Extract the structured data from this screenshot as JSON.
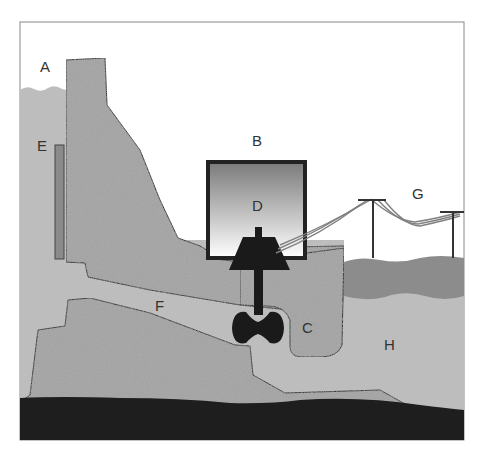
{
  "diagram": {
    "colors": {
      "frame": "#888888",
      "reservoir_water": "#bdbdbd",
      "dam_concrete": "#a8a8a8",
      "bedrock": "#1e1e1e",
      "river_surface": "#8c8c8c",
      "intake_gate": "#8a8a8a",
      "machinery": "#1a1a1a",
      "powerhouse_border": "#222222",
      "powerline": "#808080"
    },
    "labels": [
      {
        "id": "A",
        "text": "A",
        "x": 40,
        "y": 72,
        "meaning": "reservoir"
      },
      {
        "id": "B",
        "text": "B",
        "x": 252,
        "y": 146,
        "meaning": "powerhouse"
      },
      {
        "id": "C",
        "text": "C",
        "x": 302,
        "y": 333,
        "meaning": "turbine housing"
      },
      {
        "id": "D",
        "text": "D",
        "x": 252,
        "y": 211,
        "meaning": "generator"
      },
      {
        "id": "E",
        "text": "E",
        "x": 37,
        "y": 151,
        "meaning": "intake gate"
      },
      {
        "id": "F",
        "text": "F",
        "x": 155,
        "y": 311,
        "meaning": "penstock"
      },
      {
        "id": "G",
        "text": "G",
        "x": 412,
        "y": 199,
        "meaning": "power lines"
      },
      {
        "id": "H",
        "text": "H",
        "x": 384,
        "y": 350,
        "meaning": "river"
      }
    ]
  }
}
